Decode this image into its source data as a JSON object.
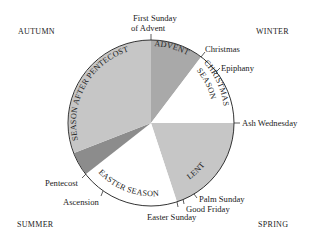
{
  "diagram": {
    "type": "liturgical-year-wheel",
    "center": [
      151,
      123
    ],
    "radius": 83,
    "colors": {
      "advent": "#a9a9a9",
      "christmas": "#ffffff",
      "lent": "#c6c6c6",
      "easter": "#ffffff",
      "pentecost": "#8c8c8c",
      "after_pentecost": "#c6c6c6",
      "outline": "#333333"
    },
    "quarters": {
      "autumn": "AUTUMN",
      "winter": "WINTER",
      "summer": "SUMMER",
      "spring": "SPRING"
    },
    "seasons": {
      "advent": "ADVENT",
      "christmas_1": "CHRISTMAS",
      "christmas_2": "SEASON",
      "lent": "LENT",
      "easter": "EASTER SEASON",
      "after_pentecost": "SEASON AFTER PENTECOST"
    },
    "markers": {
      "first_sunday_1": "First Sunday",
      "first_sunday_2": "of Advent",
      "christmas": "Christmas",
      "epiphany": "Epiphany",
      "ash_wednesday": "Ash Wednesday",
      "palm_sunday": "Palm Sunday",
      "good_friday": "Good Friday",
      "easter_sunday": "Easter Sunday",
      "ascension": "Ascension",
      "pentecost": "Pentecost"
    }
  }
}
